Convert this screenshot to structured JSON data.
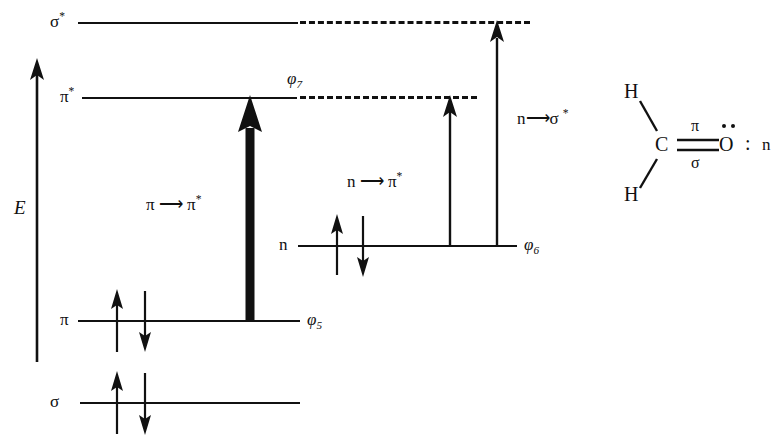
{
  "diagram": {
    "axis": {
      "label": "E",
      "name": "energy-axis"
    },
    "levels": [
      {
        "id": "sigma-star",
        "left_label": "σ",
        "left_label_sup": "*",
        "phi_label": "",
        "phi_sub": ""
      },
      {
        "id": "pi-star",
        "left_label": "π",
        "left_label_sup": "*",
        "phi_label": "φ",
        "phi_sub": "7"
      },
      {
        "id": "n",
        "left_label": "n",
        "left_label_sup": "",
        "phi_label": "φ",
        "phi_sub": "6"
      },
      {
        "id": "pi",
        "left_label": "π",
        "left_label_sup": "",
        "phi_label": "φ",
        "phi_sub": "5"
      },
      {
        "id": "sigma",
        "left_label": "σ",
        "left_label_sup": "",
        "phi_label": "",
        "phi_sub": ""
      }
    ],
    "transitions": [
      {
        "id": "pi-to-pi-star",
        "text_from": "π",
        "arrow_glyph": "⟶",
        "text_to": "π",
        "text_to_sup": "*"
      },
      {
        "id": "n-to-pi-star",
        "text_from": "n",
        "arrow_glyph": "⟶",
        "text_to": "π",
        "text_to_sup": "*"
      },
      {
        "id": "n-to-sigma-star",
        "text_from": "n",
        "arrow_glyph": "⟶",
        "text_to": "σ",
        "text_to_sup": "*"
      }
    ]
  },
  "molecule": {
    "name": "formaldehyde",
    "atom_h_top": "H",
    "atom_h_bottom": "H",
    "atom_c": "C",
    "atom_o": "O",
    "bond_label_top": "π",
    "bond_label_bottom": "σ",
    "lone_pair_colon": ":",
    "lone_pair_label": "n"
  },
  "colors": {
    "ink": "#111111",
    "background": "#ffffff"
  }
}
